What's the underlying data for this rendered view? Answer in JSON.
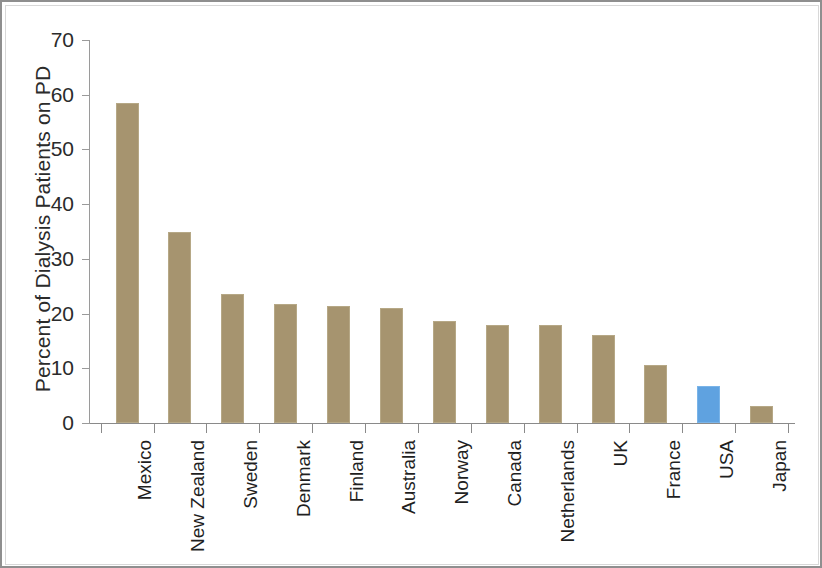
{
  "chart_data": {
    "type": "bar",
    "title": "",
    "subtitle": "",
    "xlabel": "",
    "ylabel": "Percent of Dialysis Patients on PD",
    "ylim": [
      0,
      70
    ],
    "ytick_step": 10,
    "yticks": [
      "70",
      "60",
      "50",
      "40",
      "30",
      "20",
      "10",
      "0"
    ],
    "grid": false,
    "legend": "none",
    "categories": [
      "Mexico",
      "New Zealand",
      "Sweden",
      "Denmark",
      "Finland",
      "Australia",
      "Norway",
      "Canada",
      "Netherlands",
      "UK",
      "France",
      "USA",
      "Japan"
    ],
    "values": [
      58.4,
      35.0,
      23.6,
      21.7,
      21.3,
      21.1,
      18.7,
      18.0,
      17.9,
      16.0,
      10.6,
      6.8,
      3.2
    ],
    "bar_colors": [
      "tan",
      "tan",
      "tan",
      "tan",
      "tan",
      "tan",
      "tan",
      "tan",
      "tan",
      "tan",
      "tan",
      "blue",
      "tan"
    ],
    "colors": {
      "tan": "#a6946f",
      "blue": "#5fa2e0",
      "axis": "#8a8a8a",
      "text": "#1f1f1f",
      "background": "#ffffff",
      "border": "#8f8f8f"
    }
  }
}
